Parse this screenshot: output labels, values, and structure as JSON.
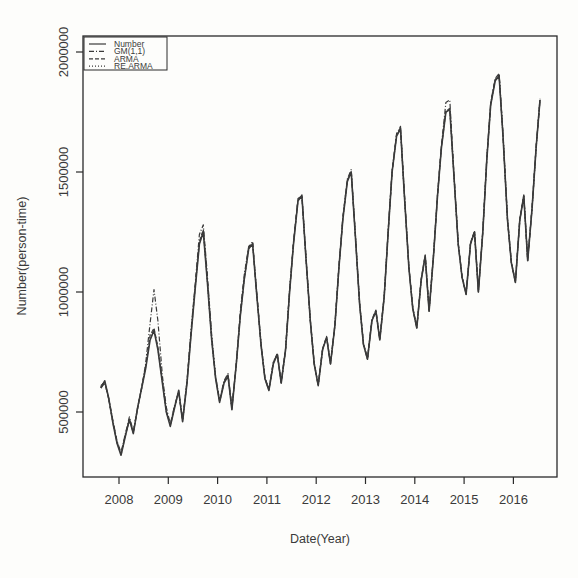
{
  "chart_data": {
    "type": "line",
    "title": "",
    "xlabel": "Date(Year)",
    "ylabel": "Number(person-time)",
    "x_ticks": [
      "2008",
      "2009",
      "2010",
      "2011",
      "2012",
      "2013",
      "2014",
      "2015",
      "2016"
    ],
    "y_ticks": [
      "500000",
      "1000000",
      "1500000",
      "2000000"
    ],
    "xlim": [
      2007.6,
      2016.9
    ],
    "ylim": [
      240000,
      2070000
    ],
    "grid": false,
    "legend_position": "top-left",
    "legend": [
      {
        "name": "Number",
        "style": "solid"
      },
      {
        "name": "GM(1,1)",
        "style": "dashdot"
      },
      {
        "name": "ARMA",
        "style": "dashed"
      },
      {
        "name": "RE.ARMA",
        "style": "dotted"
      }
    ],
    "x": [
      2007.63,
      2007.71,
      2007.79,
      2007.88,
      2007.96,
      2008.04,
      2008.13,
      2008.21,
      2008.29,
      2008.38,
      2008.46,
      2008.54,
      2008.63,
      2008.71,
      2008.79,
      2008.88,
      2008.96,
      2009.04,
      2009.13,
      2009.21,
      2009.29,
      2009.38,
      2009.46,
      2009.54,
      2009.63,
      2009.71,
      2009.79,
      2009.88,
      2009.96,
      2010.04,
      2010.13,
      2010.21,
      2010.29,
      2010.38,
      2010.46,
      2010.54,
      2010.63,
      2010.71,
      2010.79,
      2010.88,
      2010.96,
      2011.04,
      2011.13,
      2011.21,
      2011.29,
      2011.38,
      2011.46,
      2011.54,
      2011.63,
      2011.71,
      2011.79,
      2011.88,
      2011.96,
      2012.04,
      2012.13,
      2012.21,
      2012.29,
      2012.38,
      2012.46,
      2012.54,
      2012.63,
      2012.71,
      2012.79,
      2012.88,
      2012.96,
      2013.04,
      2013.13,
      2013.21,
      2013.29,
      2013.38,
      2013.46,
      2013.54,
      2013.63,
      2013.71,
      2013.79,
      2013.88,
      2013.96,
      2014.04,
      2014.13,
      2014.21,
      2014.29,
      2014.38,
      2014.46,
      2014.54,
      2014.63,
      2014.71,
      2014.79,
      2014.88,
      2014.96,
      2015.04,
      2015.13,
      2015.21,
      2015.29,
      2015.38,
      2015.46,
      2015.54,
      2015.63,
      2015.71,
      2015.79,
      2015.88,
      2015.96,
      2016.04,
      2016.13,
      2016.21,
      2016.29,
      2016.38,
      2016.46,
      2016.54
    ],
    "series": [
      {
        "name": "Number",
        "values": [
          600000,
          630000,
          560000,
          450000,
          370000,
          320000,
          400000,
          470000,
          410000,
          520000,
          600000,
          680000,
          800000,
          840000,
          760000,
          620000,
          500000,
          440000,
          520000,
          590000,
          460000,
          620000,
          820000,
          1000000,
          1200000,
          1250000,
          1050000,
          800000,
          640000,
          540000,
          620000,
          650000,
          510000,
          700000,
          900000,
          1050000,
          1180000,
          1200000,
          1000000,
          780000,
          640000,
          590000,
          700000,
          740000,
          620000,
          760000,
          1000000,
          1200000,
          1380000,
          1400000,
          1150000,
          880000,
          700000,
          610000,
          760000,
          810000,
          700000,
          860000,
          1100000,
          1300000,
          1460000,
          1500000,
          1250000,
          950000,
          780000,
          720000,
          880000,
          920000,
          800000,
          980000,
          1250000,
          1500000,
          1650000,
          1680000,
          1400000,
          1100000,
          930000,
          850000,
          1050000,
          1150000,
          920000,
          1150000,
          1400000,
          1600000,
          1750000,
          1760000,
          1500000,
          1200000,
          1060000,
          990000,
          1200000,
          1250000,
          1000000,
          1250000,
          1550000,
          1780000,
          1880000,
          1900000,
          1650000,
          1300000,
          1120000,
          1040000,
          1300000,
          1400000,
          1130000,
          1350000,
          1600000,
          1800000
        ]
      },
      {
        "name": "GM(1,1)",
        "values": [
          600000,
          620000,
          560000,
          460000,
          380000,
          330000,
          410000,
          480000,
          420000,
          520000,
          600000,
          700000,
          870000,
          1010000,
          880000,
          650000,
          520000,
          450000,
          530000,
          580000,
          470000,
          630000,
          840000,
          1020000,
          1240000,
          1280000,
          1080000,
          820000,
          650000,
          550000,
          630000,
          660000,
          520000,
          700000,
          920000,
          1070000,
          1190000,
          1210000,
          1010000,
          790000,
          640000,
          590000,
          710000,
          740000,
          620000,
          760000,
          1010000,
          1210000,
          1390000,
          1400000,
          1160000,
          880000,
          700000,
          610000,
          760000,
          810000,
          700000,
          860000,
          1100000,
          1310000,
          1470000,
          1510000,
          1260000,
          950000,
          780000,
          720000,
          880000,
          920000,
          800000,
          980000,
          1260000,
          1500000,
          1660000,
          1690000,
          1410000,
          1100000,
          930000,
          850000,
          1050000,
          1150000,
          920000,
          1150000,
          1400000,
          1610000,
          1790000,
          1800000,
          1510000,
          1200000,
          1060000,
          990000,
          1200000,
          1250000,
          1000000,
          1250000,
          1560000,
          1790000,
          1890000,
          1910000,
          1660000,
          1300000,
          1120000,
          1040000,
          1300000,
          1400000,
          1130000,
          1350000,
          1600000,
          1800000
        ]
      },
      {
        "name": "ARMA",
        "values": [
          610000,
          625000,
          555000,
          455000,
          375000,
          325000,
          405000,
          465000,
          415000,
          515000,
          605000,
          690000,
          820000,
          850000,
          770000,
          630000,
          505000,
          445000,
          525000,
          585000,
          465000,
          625000,
          825000,
          1010000,
          1210000,
          1260000,
          1060000,
          805000,
          645000,
          545000,
          625000,
          655000,
          515000,
          705000,
          905000,
          1055000,
          1185000,
          1205000,
          1005000,
          785000,
          645000,
          595000,
          705000,
          745000,
          625000,
          765000,
          1005000,
          1205000,
          1385000,
          1405000,
          1155000,
          885000,
          705000,
          615000,
          765000,
          815000,
          705000,
          865000,
          1105000,
          1305000,
          1465000,
          1505000,
          1255000,
          955000,
          785000,
          725000,
          885000,
          925000,
          805000,
          985000,
          1255000,
          1505000,
          1655000,
          1685000,
          1405000,
          1105000,
          935000,
          855000,
          1055000,
          1155000,
          925000,
          1155000,
          1405000,
          1605000,
          1755000,
          1765000,
          1505000,
          1205000,
          1065000,
          995000,
          1205000,
          1255000,
          1005000,
          1255000,
          1555000,
          1785000,
          1885000,
          1905000,
          1655000,
          1305000,
          1125000,
          1045000,
          1305000,
          1405000,
          1135000,
          1355000,
          1605000,
          1805000
        ]
      },
      {
        "name": "RE.ARMA",
        "values": [
          605000,
          628000,
          558000,
          452000,
          372000,
          322000,
          402000,
          468000,
          412000,
          518000,
          602000,
          685000,
          810000,
          845000,
          765000,
          625000,
          502000,
          442000,
          522000,
          588000,
          462000,
          622000,
          822000,
          1005000,
          1205000,
          1255000,
          1055000,
          802000,
          642000,
          542000,
          622000,
          652000,
          512000,
          702000,
          902000,
          1052000,
          1182000,
          1202000,
          1002000,
          782000,
          642000,
          592000,
          702000,
          742000,
          622000,
          762000,
          1002000,
          1202000,
          1382000,
          1402000,
          1152000,
          882000,
          702000,
          612000,
          762000,
          812000,
          702000,
          862000,
          1102000,
          1302000,
          1462000,
          1502000,
          1252000,
          952000,
          782000,
          722000,
          882000,
          922000,
          802000,
          982000,
          1252000,
          1502000,
          1652000,
          1682000,
          1402000,
          1102000,
          932000,
          852000,
          1052000,
          1152000,
          922000,
          1152000,
          1402000,
          1602000,
          1752000,
          1762000,
          1502000,
          1202000,
          1062000,
          992000,
          1202000,
          1252000,
          1002000,
          1252000,
          1552000,
          1782000,
          1882000,
          1902000,
          1652000,
          1302000,
          1122000,
          1042000,
          1302000,
          1402000,
          1132000,
          1352000,
          1602000,
          1802000
        ]
      }
    ]
  }
}
